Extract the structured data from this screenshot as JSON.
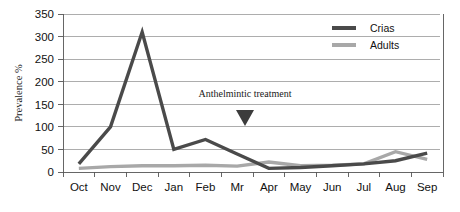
{
  "chart_data": {
    "type": "line",
    "title": "",
    "xlabel": "",
    "ylabel": "Prevalence %",
    "ylim": [
      0,
      350
    ],
    "ytick_step": 50,
    "yticks": [
      "0",
      "50",
      "100",
      "150",
      "200",
      "250",
      "300",
      "350"
    ],
    "grid": true,
    "legend_position": "top-right",
    "categories": [
      "Oct",
      "Nov",
      "Dec",
      "Jan",
      "Feb",
      "Mr",
      "Apr",
      "May",
      "Jun",
      "Jul",
      "Aug",
      "Sep"
    ],
    "series": [
      {
        "name": "Crias",
        "color": "#4a4a4a",
        "values": [
          18,
          100,
          310,
          50,
          72,
          40,
          8,
          10,
          14,
          18,
          25,
          42
        ]
      },
      {
        "name": "Adults",
        "color": "#a8a8a8",
        "values": [
          8,
          12,
          14,
          14,
          15,
          13,
          22,
          14,
          15,
          18,
          45,
          28
        ]
      }
    ],
    "annotations": [
      {
        "text": "Anthelmintic treatment",
        "marker": "down-triangle",
        "marker_color": "#3c3c3c",
        "near_category": "Mr"
      }
    ]
  },
  "legend": {
    "items": [
      {
        "label": "Crias"
      },
      {
        "label": "Adults"
      }
    ]
  },
  "axes": {
    "y_axis_title": "Prevalence %"
  }
}
